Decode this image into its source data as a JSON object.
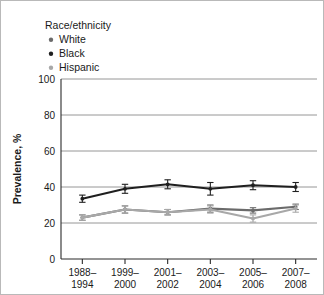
{
  "figure": {
    "background_color": "#ffffff",
    "border_color": "#b9b9b9"
  },
  "legend": {
    "title": "Race/ethnicity",
    "position": "top-left",
    "items": [
      {
        "label": "White",
        "marker": "dot-marker",
        "color": "#6b6b6b"
      },
      {
        "label": "Black",
        "marker": "dot-marker",
        "color": "#1f1f1f"
      },
      {
        "label": "Hispanic",
        "marker": "dot-marker",
        "color": "#a8a8a8"
      }
    ]
  },
  "axis": {
    "y_title": "Prevalence, %",
    "y_ticks": [
      "0",
      "20",
      "40",
      "60",
      "80",
      "100"
    ],
    "x_ticks": [
      {
        "line1": "1988–",
        "line2": "1994"
      },
      {
        "line1": "1999–",
        "line2": "2000"
      },
      {
        "line1": "2001–",
        "line2": "2002"
      },
      {
        "line1": "2003–",
        "line2": "2004"
      },
      {
        "line1": "2005–",
        "line2": "2006"
      },
      {
        "line1": "2007–",
        "line2": "2008"
      }
    ]
  },
  "chart_data": {
    "type": "line",
    "title": "",
    "subtitle": "",
    "xlabel": "",
    "ylabel": "Prevalence, %",
    "ylim": [
      0,
      100
    ],
    "yticks": [
      0,
      20,
      40,
      60,
      80,
      100
    ],
    "grid": true,
    "legend_position": "top-left",
    "legend_title": "Race/ethnicity",
    "categories": [
      "1988–1994",
      "1999–2000",
      "2001–2002",
      "2003–2004",
      "2005–2006",
      "2007–2008"
    ],
    "series": [
      {
        "name": "White",
        "color": "#6b6b6b",
        "values": [
          23.0,
          27.5,
          26.0,
          28.0,
          27.0,
          29.0
        ],
        "errors_low": [
          21.5,
          25.5,
          24.5,
          26.0,
          25.5,
          27.5
        ],
        "errors_high": [
          24.5,
          29.5,
          27.5,
          30.0,
          28.5,
          30.5
        ],
        "connected": [
          false,
          true,
          true,
          true,
          true,
          true
        ]
      },
      {
        "name": "Black",
        "color": "#1f1f1f",
        "values": [
          33.5,
          39.0,
          41.5,
          39.0,
          41.0,
          40.0
        ],
        "errors_low": [
          31.5,
          36.5,
          39.0,
          35.5,
          38.5,
          37.5
        ],
        "errors_high": [
          35.5,
          41.5,
          44.0,
          42.5,
          43.5,
          42.5
        ],
        "connected": [
          false,
          true,
          true,
          true,
          true,
          true
        ]
      },
      {
        "name": "Hispanic",
        "color": "#a8a8a8",
        "values": [
          23.0,
          27.5,
          26.0,
          27.5,
          22.5,
          28.0
        ],
        "errors_low": [
          21.5,
          25.5,
          24.5,
          25.5,
          20.5,
          26.0
        ],
        "errors_high": [
          24.5,
          29.5,
          27.5,
          29.5,
          24.5,
          30.0
        ],
        "connected": [
          false,
          true,
          true,
          true,
          true,
          true
        ]
      }
    ]
  }
}
